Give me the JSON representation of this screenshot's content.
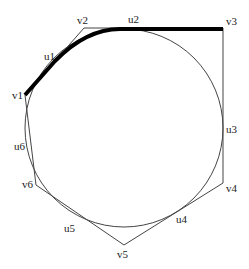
{
  "diagram": {
    "type": "circle inscribed in hexagon with highlighted arc path",
    "colors": {
      "background": "#ffffff",
      "line": "#444444",
      "highlight": "#000000",
      "text": "#222222"
    },
    "circle": {
      "cx": 124,
      "cy": 128,
      "r": 99
    },
    "polygon_vertices": [
      {
        "id": "v1",
        "label": "v1",
        "x": 25,
        "y": 95,
        "lx": 12,
        "ly": 99
      },
      {
        "id": "v2",
        "label": "v2",
        "x": 84,
        "y": 28,
        "lx": 77,
        "ly": 24
      },
      {
        "id": "v3",
        "label": "v3",
        "x": 223,
        "y": 28,
        "lx": 226,
        "ly": 25
      },
      {
        "id": "v4",
        "label": "v4",
        "x": 223,
        "y": 183,
        "lx": 226,
        "ly": 192
      },
      {
        "id": "v5",
        "label": "v5",
        "x": 124,
        "y": 245,
        "lx": 117,
        "ly": 258
      },
      {
        "id": "v6",
        "label": "v6",
        "x": 36,
        "y": 185,
        "lx": 22,
        "ly": 188
      }
    ],
    "tangent_points": [
      {
        "id": "u1",
        "label": "u1",
        "lx": 44,
        "ly": 60
      },
      {
        "id": "u2",
        "label": "u2",
        "lx": 128,
        "ly": 23
      },
      {
        "id": "u3",
        "label": "u3",
        "lx": 226,
        "ly": 133
      },
      {
        "id": "u4",
        "label": "u4",
        "lx": 176,
        "ly": 223
      },
      {
        "id": "u5",
        "label": "u5",
        "lx": 64,
        "ly": 232
      },
      {
        "id": "u6",
        "label": "u6",
        "lx": 14,
        "ly": 150
      }
    ],
    "highlight_path": {
      "description": "thick path from v1 along tangent to u1, arc u1 to u2, straight to v3",
      "d": "M 25 95 L 55 61 Q 88 27 124 29 L 223 29"
    }
  }
}
